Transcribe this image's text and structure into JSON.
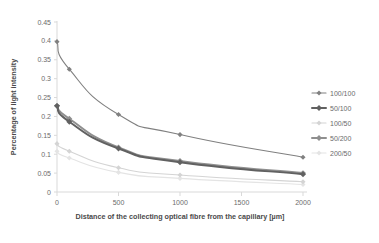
{
  "chart_data": {
    "type": "line",
    "title": "",
    "xlabel": "Distance of the collecting optical fibre from the capillary [µm]",
    "ylabel": "Percentage of light intensity",
    "x": [
      0,
      100,
      500,
      1000,
      2000
    ],
    "xlim": [
      0,
      2000
    ],
    "ylim": [
      0,
      0.45
    ],
    "xticks": [
      "0",
      "500",
      "1000",
      "1500",
      "2000"
    ],
    "xtick_values": [
      0,
      500,
      1000,
      1500,
      2000
    ],
    "yticks": [
      "0",
      "0.05",
      "0.1",
      "0.15",
      "0.2",
      "0.25",
      "0.3",
      "0.35",
      "0.4",
      "0.45"
    ],
    "ytick_values": [
      0,
      0.05,
      0.1,
      0.15,
      0.2,
      0.25,
      0.3,
      0.35,
      0.4,
      0.45
    ],
    "grid": false,
    "legend_position": "right",
    "series": [
      {
        "name": "100/100",
        "color": "#808080",
        "width": 1.1,
        "marker": "diamond",
        "values": [
          0.398,
          0.325,
          0.205,
          0.152,
          0.092
        ]
      },
      {
        "name": "50/100",
        "color": "#616161",
        "width": 2.0,
        "marker": "diamond",
        "values": [
          0.228,
          0.186,
          0.115,
          0.079,
          0.047
        ]
      },
      {
        "name": "100/50",
        "color": "#d4d4d4",
        "width": 1.1,
        "marker": "diamond",
        "values": [
          0.128,
          0.108,
          0.064,
          0.045,
          0.027
        ]
      },
      {
        "name": "50/200",
        "color": "#8f8f8f",
        "width": 2.0,
        "marker": "diamond",
        "values": [
          0.228,
          0.194,
          0.118,
          0.082,
          0.05
        ]
      },
      {
        "name": "200/50",
        "color": "#e4e4e4",
        "width": 1.1,
        "marker": "diamond",
        "values": [
          0.108,
          0.09,
          0.052,
          0.036,
          0.02
        ]
      }
    ]
  },
  "legend": {
    "items": [
      {
        "label": "100/100"
      },
      {
        "label": "50/100"
      },
      {
        "label": "100/50"
      },
      {
        "label": "50/200"
      },
      {
        "label": "200/50"
      }
    ]
  },
  "axes": {
    "x_title": "Distance of the collecting optical fibre from the capillary [µm]",
    "y_title": "Percentage of light intensity"
  },
  "colors": {
    "axis_line": "#d9d9d9",
    "tick_label": "#6b6b6b",
    "axis_title": "#4a4a4a",
    "background": "#ffffff"
  }
}
